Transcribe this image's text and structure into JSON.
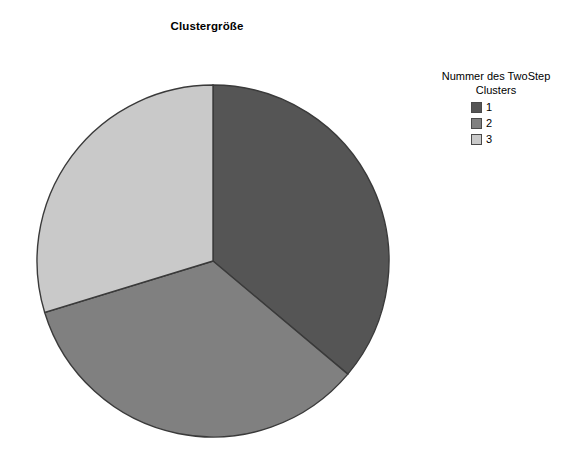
{
  "chart_data": {
    "type": "pie",
    "title": "Clustergröße",
    "xlabel": "",
    "ylabel": "",
    "categories": [
      "1",
      "2",
      "3"
    ],
    "values": [
      36.1,
      34.2,
      29.7
    ],
    "value_unit": "percent",
    "slices": [
      {
        "label": "1",
        "value": 36.1,
        "color": "#555555",
        "start_angle_deg": 0,
        "end_angle_deg": 130
      },
      {
        "label": "2",
        "value": 34.2,
        "color": "#808080",
        "start_angle_deg": 130,
        "end_angle_deg": 253
      },
      {
        "label": "3",
        "value": 29.7,
        "color": "#c9c9c9",
        "start_angle_deg": 253,
        "end_angle_deg": 360
      }
    ],
    "start_angle_deg": 0,
    "direction": "clockwise",
    "grid": false,
    "legend_position": "right",
    "legend_title": "Nummer des TwoStep Clusters",
    "legend_entries": [
      "1",
      "2",
      "3"
    ],
    "outline_color": "#3a3a3a",
    "background_color": "#ffffff"
  },
  "chart": {
    "title": "Clustergröße"
  },
  "legend": {
    "title_line1": "Nummer des TwoStep",
    "title_line2": "Clusters",
    "items": [
      {
        "label": "1",
        "color": "#555555"
      },
      {
        "label": "2",
        "color": "#808080"
      },
      {
        "label": "3",
        "color": "#c9c9c9"
      }
    ]
  },
  "geometry": {
    "center_x": 180,
    "center_y": 193,
    "radius": 176
  }
}
